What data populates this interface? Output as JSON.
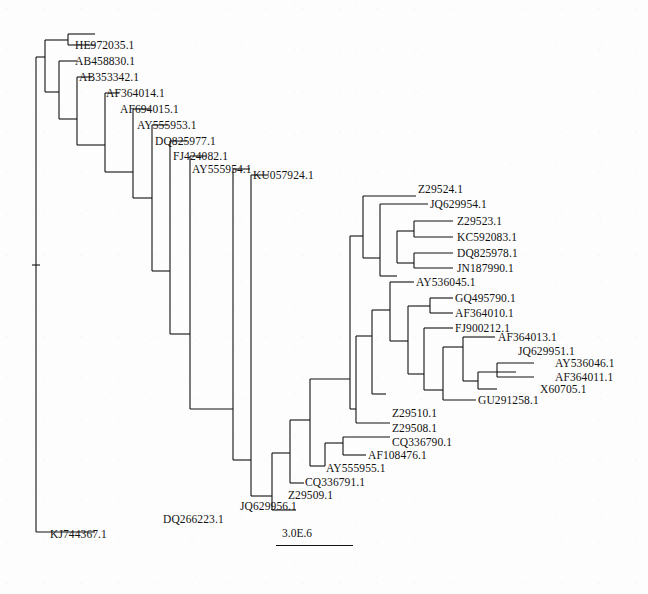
{
  "figure": {
    "type": "phylogram",
    "width": 648,
    "height": 594,
    "background_color": "#fdfdfd",
    "line_color": "#111111",
    "text_color": "#111111"
  },
  "scale": {
    "label": "3.0E.6",
    "label_x": 282,
    "label_y": 528,
    "bar_x": 276,
    "bar_y": 545,
    "bar_width": 77
  },
  "chart_data": {
    "type": "tree",
    "title": "",
    "scale_bar": "3.0E.6",
    "tip_count": 32,
    "tips": [
      {
        "id": "HE972035.1",
        "label": "HE972035.1",
        "x": 75,
        "y": 46
      },
      {
        "id": "AB458830.1",
        "label": "AB458830.1",
        "x": 75,
        "y": 62
      },
      {
        "id": "AB353342.1",
        "label": "AB353342.1",
        "x": 79,
        "y": 78
      },
      {
        "id": "AF364014.1",
        "label": "AF364014.1",
        "x": 106,
        "y": 94
      },
      {
        "id": "AF694015.1",
        "label": "AF694015.1",
        "x": 120,
        "y": 110
      },
      {
        "id": "AY555953.1",
        "label": "AY555953.1",
        "x": 137,
        "y": 126
      },
      {
        "id": "DQ825977.1",
        "label": "DQ825977.1",
        "x": 155,
        "y": 142
      },
      {
        "id": "FJ424082.1",
        "label": "FJ424082.1",
        "x": 173,
        "y": 157
      },
      {
        "id": "AY555954.1",
        "label": "AY555954.1",
        "x": 192,
        "y": 170
      },
      {
        "id": "KU057924.1",
        "label": "KU057924.1",
        "x": 253,
        "y": 176
      },
      {
        "id": "Z29524.1",
        "label": "Z29524.1",
        "x": 418,
        "y": 190
      },
      {
        "id": "JQ629954.1",
        "label": "JQ629954.1",
        "x": 430,
        "y": 205
      },
      {
        "id": "Z29523.1",
        "label": "Z29523.1",
        "x": 457,
        "y": 222
      },
      {
        "id": "KC592083.1",
        "label": "KC592083.1",
        "x": 457,
        "y": 238
      },
      {
        "id": "DQ825978.1",
        "label": "DQ825978.1",
        "x": 457,
        "y": 254
      },
      {
        "id": "JN187990.1",
        "label": "JN187990.1",
        "x": 457,
        "y": 269
      },
      {
        "id": "AY536045.1",
        "label": "AY536045.1",
        "x": 416,
        "y": 283
      },
      {
        "id": "GQ495790.1",
        "label": "GQ495790.1",
        "x": 455,
        "y": 299
      },
      {
        "id": "AF364010.1",
        "label": "AF364010.1",
        "x": 455,
        "y": 314
      },
      {
        "id": "FJ900212.1",
        "label": "FJ900212.1",
        "x": 455,
        "y": 329
      },
      {
        "id": "AF364013.1",
        "label": "AF364013.1",
        "x": 498,
        "y": 338
      },
      {
        "id": "JQ629951.1",
        "label": "JQ629951.1",
        "x": 518,
        "y": 352
      },
      {
        "id": "AY536046.1",
        "label": "AY536046.1",
        "x": 555,
        "y": 364
      },
      {
        "id": "AF364011.1",
        "label": "AF364011.1",
        "x": 555,
        "y": 378
      },
      {
        "id": "X60705.1",
        "label": "X60705.1",
        "x": 540,
        "y": 390
      },
      {
        "id": "GU291258.1",
        "label": "GU291258.1",
        "x": 478,
        "y": 401
      },
      {
        "id": "Z29510.1",
        "label": "Z29510.1",
        "x": 392,
        "y": 414
      },
      {
        "id": "Z29508.1",
        "label": "Z29508.1",
        "x": 392,
        "y": 429
      },
      {
        "id": "CQ336790.1",
        "label": "CQ336790.1",
        "x": 392,
        "y": 443
      },
      {
        "id": "AF108476.1",
        "label": "AF108476.1",
        "x": 368,
        "y": 456
      },
      {
        "id": "AY555955.1",
        "label": "AY555955.1",
        "x": 326,
        "y": 469
      },
      {
        "id": "CQ336791.1",
        "label": "CQ336791.1",
        "x": 305,
        "y": 483
      },
      {
        "id": "Z29509.1",
        "label": "Z29509.1",
        "x": 288,
        "y": 496
      },
      {
        "id": "JQ629956.1",
        "label": "JQ629956.1",
        "x": 240,
        "y": 507
      },
      {
        "id": "DQ266223.1",
        "label": "DQ266223.1",
        "x": 163,
        "y": 520
      },
      {
        "id": "KJ744367.1",
        "label": "KJ744367.1",
        "x": 50,
        "y": 535
      }
    ],
    "branches": [
      {
        "type": "v",
        "x": 36,
        "y1": 57,
        "y2": 532
      },
      {
        "type": "h",
        "y": 57,
        "x1": 36,
        "x2": 45
      },
      {
        "type": "v",
        "x": 45,
        "y1": 40,
        "y2": 92
      },
      {
        "type": "h",
        "y": 40,
        "x1": 45,
        "x2": 68
      },
      {
        "type": "v",
        "x": 68,
        "y1": 34,
        "y2": 45
      },
      {
        "type": "h",
        "y": 34,
        "x1": 68,
        "x2": 95
      },
      {
        "type": "h",
        "y": 45,
        "x1": 68,
        "x2": 95
      },
      {
        "type": "h",
        "y": 92,
        "x1": 45,
        "x2": 59
      },
      {
        "type": "v",
        "x": 59,
        "y1": 61,
        "y2": 119
      },
      {
        "type": "h",
        "y": 61,
        "x1": 59,
        "x2": 77
      },
      {
        "type": "h",
        "y": 119,
        "x1": 59,
        "x2": 77
      },
      {
        "type": "v",
        "x": 77,
        "y1": 77,
        "y2": 145
      },
      {
        "type": "h",
        "y": 77,
        "x1": 77,
        "x2": 92
      },
      {
        "type": "h",
        "y": 145,
        "x1": 77,
        "x2": 105
      },
      {
        "type": "v",
        "x": 105,
        "y1": 93,
        "y2": 172
      },
      {
        "type": "h",
        "y": 93,
        "x1": 105,
        "x2": 119
      },
      {
        "type": "h",
        "y": 172,
        "x1": 105,
        "x2": 133
      },
      {
        "type": "v",
        "x": 133,
        "y1": 109,
        "y2": 198
      },
      {
        "type": "h",
        "y": 109,
        "x1": 133,
        "x2": 150
      },
      {
        "type": "h",
        "y": 198,
        "x1": 133,
        "x2": 152
      },
      {
        "type": "v",
        "x": 152,
        "y1": 125,
        "y2": 271
      },
      {
        "type": "h",
        "y": 125,
        "x1": 152,
        "x2": 168
      },
      {
        "type": "h",
        "y": 271,
        "x1": 152,
        "x2": 170
      },
      {
        "type": "v",
        "x": 170,
        "y1": 141,
        "y2": 334
      },
      {
        "type": "h",
        "y": 141,
        "x1": 170,
        "x2": 187
      },
      {
        "type": "h",
        "y": 334,
        "x1": 170,
        "x2": 190
      },
      {
        "type": "v",
        "x": 190,
        "y1": 156,
        "y2": 409
      },
      {
        "type": "h",
        "y": 156,
        "x1": 190,
        "x2": 206
      },
      {
        "type": "h",
        "y": 409,
        "x1": 190,
        "x2": 233
      },
      {
        "type": "v",
        "x": 233,
        "y1": 169,
        "y2": 460
      },
      {
        "type": "h",
        "y": 169,
        "x1": 233,
        "x2": 250
      },
      {
        "type": "h",
        "y": 460,
        "x1": 233,
        "x2": 251
      },
      {
        "type": "v",
        "x": 251,
        "y1": 175,
        "y2": 496
      },
      {
        "type": "h",
        "y": 175,
        "x1": 251,
        "x2": 268
      },
      {
        "type": "h",
        "y": 496,
        "x1": 251,
        "x2": 272
      },
      {
        "type": "v",
        "x": 272,
        "y1": 453,
        "y2": 510
      },
      {
        "type": "h",
        "y": 510,
        "x1": 272,
        "x2": 296
      },
      {
        "type": "h",
        "y": 453,
        "x1": 272,
        "x2": 290
      },
      {
        "type": "v",
        "x": 290,
        "y1": 420,
        "y2": 483
      },
      {
        "type": "h",
        "y": 483,
        "x1": 290,
        "x2": 304
      },
      {
        "type": "h",
        "y": 420,
        "x1": 290,
        "x2": 310
      },
      {
        "type": "v",
        "x": 310,
        "y1": 379,
        "y2": 466
      },
      {
        "type": "h",
        "y": 466,
        "x1": 310,
        "x2": 325
      },
      {
        "type": "v",
        "x": 325,
        "y1": 443,
        "y2": 466
      },
      {
        "type": "h",
        "y": 443,
        "x1": 325,
        "x2": 343
      },
      {
        "type": "v",
        "x": 343,
        "y1": 437,
        "y2": 455
      },
      {
        "type": "h",
        "y": 437,
        "x1": 343,
        "x2": 390
      },
      {
        "type": "h",
        "y": 455,
        "x1": 343,
        "x2": 366
      },
      {
        "type": "h",
        "y": 379,
        "x1": 310,
        "x2": 350
      },
      {
        "type": "v",
        "x": 350,
        "y1": 236,
        "y2": 409
      },
      {
        "type": "h",
        "y": 409,
        "x1": 350,
        "x2": 356
      },
      {
        "type": "v",
        "x": 356,
        "y1": 336,
        "y2": 423
      },
      {
        "type": "h",
        "y": 423,
        "x1": 356,
        "x2": 390
      },
      {
        "type": "h",
        "y": 336,
        "x1": 356,
        "x2": 372
      },
      {
        "type": "v",
        "x": 372,
        "y1": 310,
        "y2": 394
      },
      {
        "type": "h",
        "y": 394,
        "x1": 372,
        "x2": 386
      },
      {
        "type": "h",
        "y": 310,
        "x1": 372,
        "x2": 390
      },
      {
        "type": "v",
        "x": 390,
        "y1": 282,
        "y2": 341
      },
      {
        "type": "h",
        "y": 282,
        "x1": 390,
        "x2": 414
      },
      {
        "type": "h",
        "y": 341,
        "x1": 390,
        "x2": 408
      },
      {
        "type": "v",
        "x": 408,
        "y1": 306,
        "y2": 374
      },
      {
        "type": "h",
        "y": 306,
        "x1": 408,
        "x2": 430
      },
      {
        "type": "v",
        "x": 430,
        "y1": 298,
        "y2": 313
      },
      {
        "type": "h",
        "y": 298,
        "x1": 430,
        "x2": 453
      },
      {
        "type": "h",
        "y": 313,
        "x1": 430,
        "x2": 453
      },
      {
        "type": "h",
        "y": 374,
        "x1": 408,
        "x2": 424
      },
      {
        "type": "v",
        "x": 424,
        "y1": 328,
        "y2": 390
      },
      {
        "type": "h",
        "y": 328,
        "x1": 424,
        "x2": 453
      },
      {
        "type": "h",
        "y": 390,
        "x1": 424,
        "x2": 443
      },
      {
        "type": "v",
        "x": 443,
        "y1": 347,
        "y2": 400
      },
      {
        "type": "h",
        "y": 347,
        "x1": 443,
        "x2": 463
      },
      {
        "type": "v",
        "x": 463,
        "y1": 337,
        "y2": 381
      },
      {
        "type": "h",
        "y": 337,
        "x1": 463,
        "x2": 495
      },
      {
        "type": "h",
        "y": 381,
        "x1": 463,
        "x2": 478
      },
      {
        "type": "v",
        "x": 478,
        "y1": 372,
        "y2": 389
      },
      {
        "type": "h",
        "y": 372,
        "x1": 478,
        "x2": 516
      },
      {
        "type": "h",
        "y": 389,
        "x1": 478,
        "x2": 497
      },
      {
        "type": "v",
        "x": 497,
        "y1": 363,
        "y2": 377
      },
      {
        "type": "h",
        "y": 363,
        "x1": 497,
        "x2": 534
      },
      {
        "type": "h",
        "y": 377,
        "x1": 497,
        "x2": 534
      },
      {
        "type": "h",
        "y": 400,
        "x1": 443,
        "x2": 476
      },
      {
        "type": "h",
        "y": 236,
        "x1": 350,
        "x2": 363
      },
      {
        "type": "v",
        "x": 363,
        "y1": 196,
        "y2": 258
      },
      {
        "type": "h",
        "y": 196,
        "x1": 363,
        "x2": 416
      },
      {
        "type": "h",
        "y": 258,
        "x1": 363,
        "x2": 380
      },
      {
        "type": "v",
        "x": 380,
        "y1": 204,
        "y2": 276
      },
      {
        "type": "h",
        "y": 204,
        "x1": 380,
        "x2": 428
      },
      {
        "type": "h",
        "y": 276,
        "x1": 380,
        "x2": 397
      },
      {
        "type": "v",
        "x": 397,
        "y1": 231,
        "y2": 263
      },
      {
        "type": "h",
        "y": 231,
        "x1": 397,
        "x2": 414
      },
      {
        "type": "v",
        "x": 414,
        "y1": 221,
        "y2": 237
      },
      {
        "type": "h",
        "y": 221,
        "x1": 414,
        "x2": 453
      },
      {
        "type": "h",
        "y": 237,
        "x1": 414,
        "x2": 453
      },
      {
        "type": "h",
        "y": 263,
        "x1": 397,
        "x2": 414
      },
      {
        "type": "v",
        "x": 414,
        "y1": 253,
        "y2": 268
      },
      {
        "type": "h",
        "y": 253,
        "x1": 414,
        "x2": 453
      },
      {
        "type": "h",
        "y": 268,
        "x1": 414,
        "x2": 453
      },
      {
        "type": "h",
        "y": 532,
        "x1": 36,
        "x2": 95
      },
      {
        "type": "h",
        "y": 265,
        "x1": 32,
        "x2": 40
      }
    ]
  }
}
